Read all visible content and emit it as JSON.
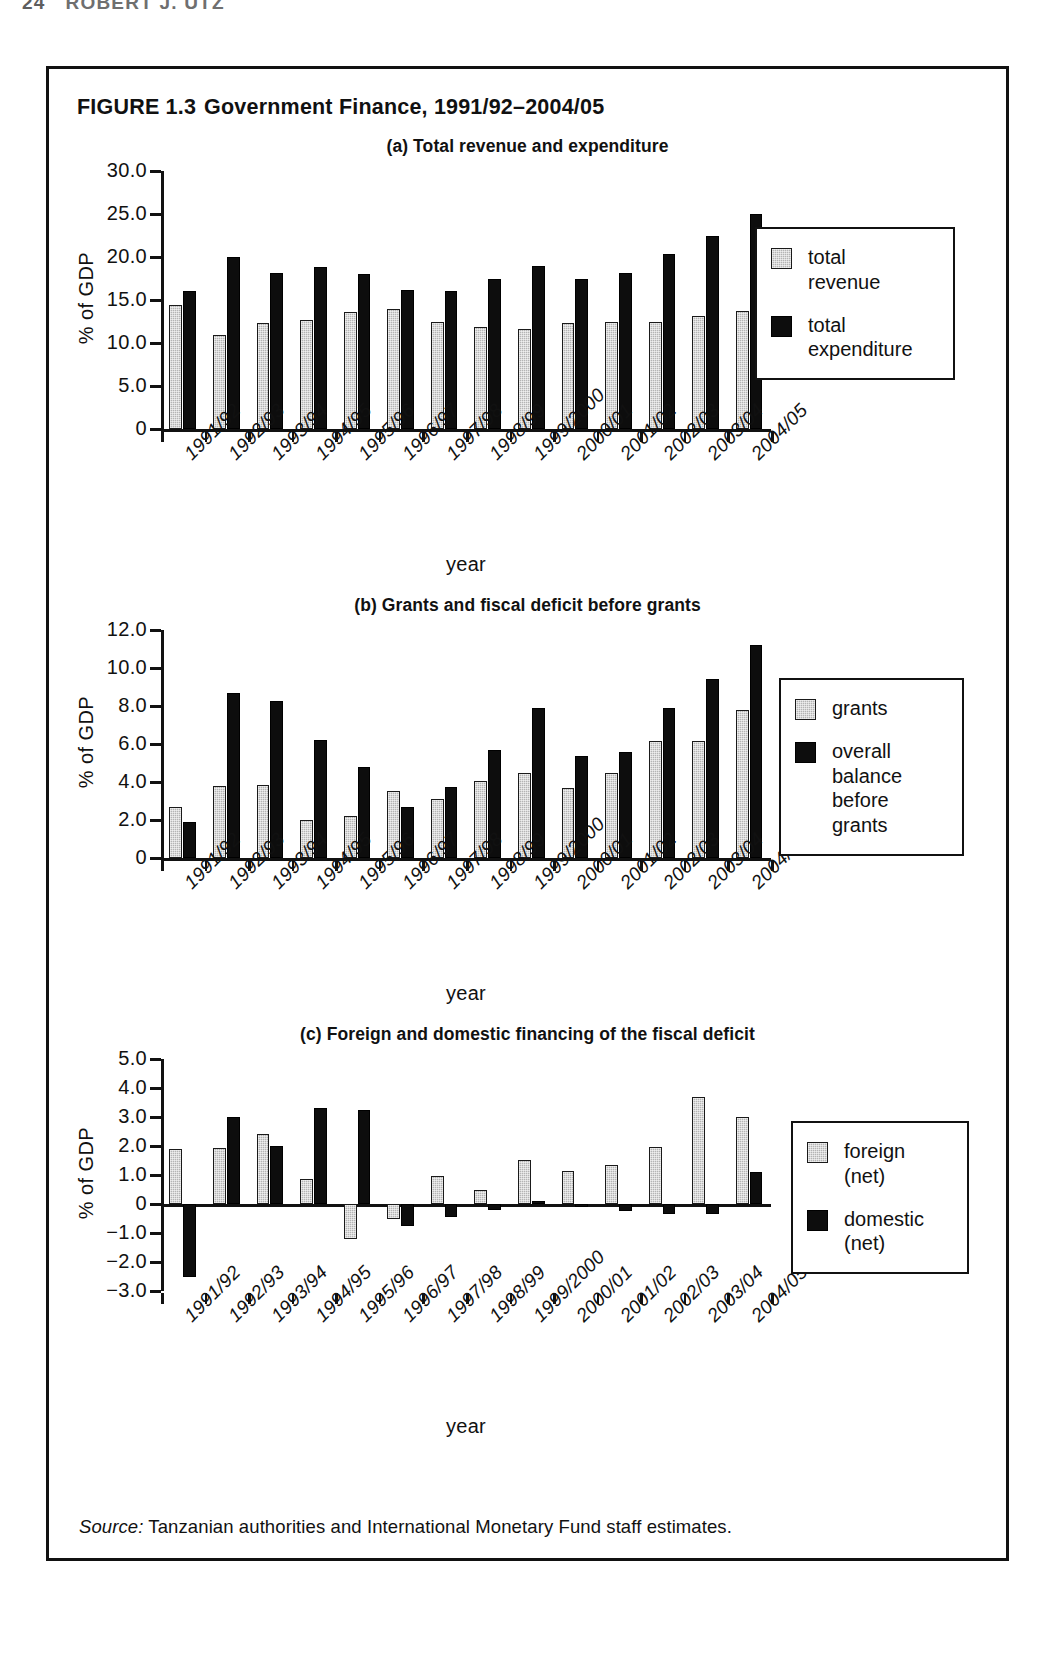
{
  "running_head": {
    "folio": "24",
    "author": "ROBERT J. UTZ"
  },
  "figure": {
    "label": "FIGURE 1.3",
    "title": "Government Finance, 1991/92–2004/05",
    "source_word": "Source:",
    "source_text": " Tanzanian authorities and International Monetary Fund staff estimates."
  },
  "categories": [
    "1991/92",
    "1992/93",
    "1993/94",
    "1994/95",
    "1995/96",
    "1996/97",
    "1997/98",
    "1998/99",
    "1999/2000",
    "2000/01",
    "2001/02",
    "2002/03",
    "2003/04",
    "2004/05"
  ],
  "axis_title_x": "year",
  "axis_title_y": "% of GDP",
  "panels": {
    "a": {
      "title": "(a) Total revenue and expenditure",
      "legend": [
        {
          "name": "total-revenue",
          "label": "total\nrevenue"
        },
        {
          "name": "total-expenditure",
          "label": "total\nexpenditure"
        }
      ],
      "yticks": [
        "30.0",
        "25.0",
        "20.0",
        "15.0",
        "10.0",
        "5.0",
        "0"
      ]
    },
    "b": {
      "title": "(b) Grants and fiscal deficit before grants",
      "legend": [
        {
          "name": "grants",
          "label": "grants"
        },
        {
          "name": "overall-balance-before-grants",
          "label": "overall\nbalance\nbefore\ngrants"
        }
      ],
      "yticks": [
        "12.0",
        "10.0",
        "8.0",
        "6.0",
        "4.0",
        "2.0",
        "0"
      ]
    },
    "c": {
      "title": "(c) Foreign and domestic financing of the fiscal deficit",
      "legend": [
        {
          "name": "foreign-net",
          "label": "foreign\n(net)"
        },
        {
          "name": "domestic-net",
          "label": "domestic\n(net)"
        }
      ],
      "yticks": [
        "5.0",
        "4.0",
        "3.0",
        "2.0",
        "1.0",
        "0",
        "−1.0",
        "−2.0",
        "−3.0"
      ]
    }
  },
  "chart_data": [
    {
      "id": "a",
      "type": "bar",
      "title": "(a) Total revenue and expenditure",
      "xlabel": "year",
      "ylabel": "% of GDP",
      "ylim": [
        0,
        30
      ],
      "yticks": [
        0,
        5,
        10,
        15,
        20,
        25,
        30
      ],
      "grid": false,
      "legend_position": "right",
      "categories": [
        "1991/92",
        "1992/93",
        "1993/94",
        "1994/95",
        "1995/96",
        "1996/97",
        "1997/98",
        "1998/99",
        "1999/2000",
        "2000/01",
        "2001/02",
        "2002/03",
        "2003/04",
        "2004/05"
      ],
      "series": [
        {
          "name": "total revenue",
          "color": "#b4b4b4",
          "values": [
            14.4,
            10.9,
            12.3,
            12.7,
            13.6,
            13.9,
            12.4,
            11.9,
            11.6,
            12.3,
            12.4,
            12.4,
            13.1,
            13.7
          ]
        },
        {
          "name": "total expenditure",
          "color": "#0d0d0d",
          "values": [
            16.1,
            20.0,
            18.1,
            18.8,
            18.0,
            16.2,
            16.0,
            17.4,
            19.0,
            17.4,
            18.1,
            20.3,
            22.4,
            25.0
          ]
        }
      ]
    },
    {
      "id": "b",
      "type": "bar",
      "title": "(b) Grants and fiscal deficit before grants",
      "xlabel": "year",
      "ylabel": "% of GDP",
      "ylim": [
        0,
        12
      ],
      "yticks": [
        0,
        2,
        4,
        6,
        8,
        10,
        12
      ],
      "grid": false,
      "legend_position": "right",
      "categories": [
        "1991/92",
        "1992/93",
        "1993/94",
        "1994/95",
        "1995/96",
        "1996/97",
        "1997/98",
        "1998/99",
        "1999/2000",
        "2000/01",
        "2001/02",
        "2002/03",
        "2003/04",
        "2004/05"
      ],
      "series": [
        {
          "name": "grants",
          "color": "#b4b4b4",
          "values": [
            2.7,
            3.8,
            3.85,
            2.0,
            2.2,
            3.55,
            3.1,
            4.05,
            4.5,
            3.7,
            4.45,
            6.15,
            6.15,
            7.8
          ]
        },
        {
          "name": "overall balance before grants",
          "color": "#0d0d0d",
          "values": [
            1.9,
            8.7,
            8.25,
            6.2,
            4.8,
            2.7,
            3.75,
            5.7,
            7.9,
            5.35,
            5.6,
            7.9,
            9.4,
            11.2
          ]
        }
      ]
    },
    {
      "id": "c",
      "type": "bar",
      "title": "(c) Foreign and domestic financing of the fiscal deficit",
      "xlabel": "year",
      "ylabel": "% of GDP",
      "ylim": [
        -3,
        5
      ],
      "yticks": [
        -3,
        -2,
        -1,
        0,
        1,
        2,
        3,
        4,
        5
      ],
      "grid": false,
      "legend_position": "right",
      "categories": [
        "1991/92",
        "1992/93",
        "1993/94",
        "1994/95",
        "1995/96",
        "1996/97",
        "1997/98",
        "1998/99",
        "1999/2000",
        "2000/01",
        "2001/02",
        "2002/03",
        "2003/04",
        "2004/05"
      ],
      "series": [
        {
          "name": "foreign (net)",
          "color": "#b4b4b4",
          "values": [
            1.88,
            1.92,
            2.4,
            0.87,
            -1.2,
            -0.5,
            0.97,
            0.48,
            1.52,
            1.15,
            1.35,
            1.98,
            3.7,
            3.0
          ]
        },
        {
          "name": "domestic (net)",
          "color": "#0d0d0d",
          "values": [
            -2.5,
            3.0,
            2.0,
            3.3,
            3.25,
            -0.75,
            -0.45,
            -0.2,
            0.12,
            -0.1,
            -0.25,
            -0.35,
            -0.35,
            1.1
          ]
        }
      ]
    }
  ]
}
